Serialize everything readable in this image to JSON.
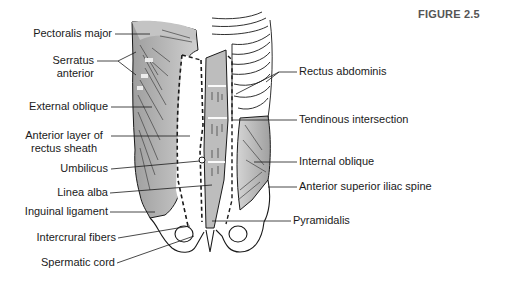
{
  "figure": {
    "title": "FIGURE 2.5"
  },
  "labels_left": [
    {
      "id": "pectoralis-major",
      "text": "Pectoralis major"
    },
    {
      "id": "serratus-anterior",
      "text": "Serratus\nanterior",
      "line1": "Serratus",
      "line2": "anterior"
    },
    {
      "id": "external-oblique",
      "text": "External oblique"
    },
    {
      "id": "anterior-layer-rectus-sheath",
      "line1": "Anterior layer of",
      "line2": "rectus sheath"
    },
    {
      "id": "umbilicus",
      "text": "Umbilicus"
    },
    {
      "id": "linea-alba",
      "text": "Linea alba"
    },
    {
      "id": "inguinal-ligament",
      "text": "Inguinal ligament"
    },
    {
      "id": "intercrural-fibers",
      "text": "Intercrural fibers"
    },
    {
      "id": "spermatic-cord",
      "text": "Spermatic cord"
    }
  ],
  "labels_right": [
    {
      "id": "rectus-abdominis",
      "text": "Rectus abdominis"
    },
    {
      "id": "tendinous-intersection",
      "text": "Tendinous intersection"
    },
    {
      "id": "internal-oblique",
      "text": "Internal oblique"
    },
    {
      "id": "anterior-superior-iliac-spine",
      "text": "Anterior superior iliac spine"
    },
    {
      "id": "pyramidalis",
      "text": "Pyramidalis"
    }
  ],
  "colors": {
    "muscle_shade": "#b8b8b8",
    "muscle_light": "#d6d6d6",
    "outline": "#1a1a1a",
    "title": "#555555"
  }
}
